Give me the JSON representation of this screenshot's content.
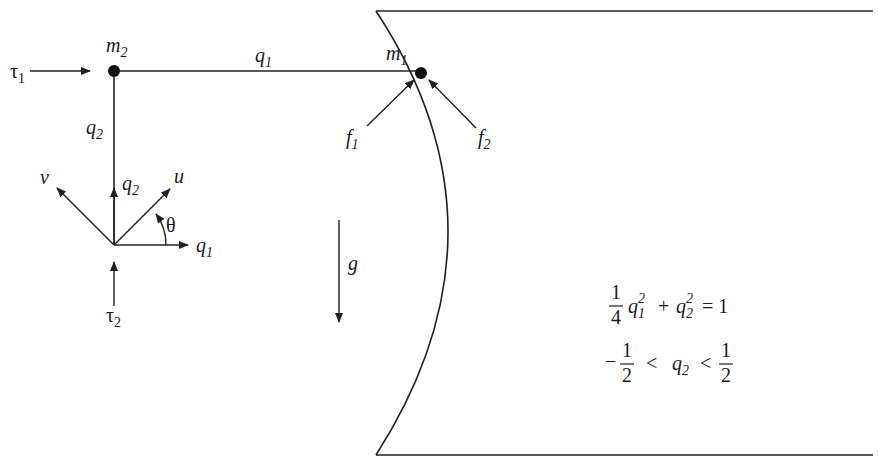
{
  "diagram": {
    "masses": {
      "m1": {
        "symbol": "m",
        "sub": "1"
      },
      "m2": {
        "symbol": "m",
        "sub": "2"
      }
    },
    "link_labels": {
      "horizontal": {
        "symbol": "q",
        "sub": "1"
      },
      "vertical": {
        "symbol": "q",
        "sub": "2"
      }
    },
    "inputs": {
      "tau1": {
        "symbol": "τ",
        "sub": "1"
      },
      "tau2": {
        "symbol": "τ",
        "sub": "2"
      }
    },
    "forces": {
      "f1": {
        "symbol": "f",
        "sub": "1"
      },
      "f2": {
        "symbol": "f",
        "sub": "2"
      }
    },
    "frame": {
      "v": "v",
      "u": "u",
      "q2": {
        "symbol": "q",
        "sub": "2"
      },
      "q1": {
        "symbol": "q",
        "sub": "1"
      },
      "theta": "θ"
    },
    "gravity": "g",
    "equations": {
      "constraint": {
        "frac_num": "1",
        "frac_den": "4",
        "term1": {
          "symbol": "q",
          "sub": "1",
          "sup": "2"
        },
        "plus": "+",
        "term2": {
          "symbol": "q",
          "sub": "2",
          "sup": "2"
        },
        "rhs": "= 1"
      },
      "bounds": {
        "neg": "−",
        "lo_num": "1",
        "lo_den": "2",
        "lt1": "<",
        "var": {
          "symbol": "q",
          "sub": "2"
        },
        "lt2": "<",
        "hi_num": "1",
        "hi_den": "2"
      }
    }
  }
}
